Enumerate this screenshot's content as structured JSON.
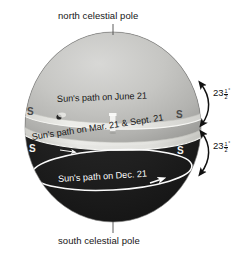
{
  "diagram": {
    "background_color": "#ffffff",
    "sphere": {
      "upper_hemisphere_color": "#b9b9b7",
      "lower_hemisphere_color": "#1d1d1d",
      "outline_color": "#8a8a88"
    },
    "poles": {
      "north": {
        "label": "north celestial pole",
        "leader_line": true
      },
      "south": {
        "label": "south celestial pole",
        "leader_line": true
      }
    },
    "sun_paths": [
      {
        "id": "june",
        "label": "Sun's path on June 21",
        "band_color": "#e9e9e6",
        "on_dark": false,
        "s_marker_left": "S",
        "s_marker_right": "S"
      },
      {
        "id": "equinox",
        "label": "Sun's path on Mar. 21 & Sept. 21",
        "band_color": "#e3e3df",
        "on_dark": false,
        "s_marker_left": "S",
        "s_marker_right": "S"
      },
      {
        "id": "december",
        "label": "Sun's path on Dec. 21",
        "band_color": "#ffffff",
        "on_dark": true,
        "s_marker_left": "",
        "s_marker_right": ""
      }
    ],
    "angles": [
      {
        "id": "upper",
        "whole": "23",
        "fraction_numerator": "1",
        "fraction_denominator": "2",
        "degree_symbol": "°",
        "full_text": "23½°",
        "arrow_style": "double-headed-curved",
        "description": "angle between June solstice path and celestial equator"
      },
      {
        "id": "lower",
        "whole": "23",
        "fraction_numerator": "1",
        "fraction_denominator": "2",
        "degree_symbol": "°",
        "full_text": "23½°",
        "arrow_style": "double-headed-curved",
        "description": "angle between celestial equator and December solstice path"
      }
    ],
    "observer_marker": {
      "name": "observer-pillar",
      "color": "#f4f4f2"
    },
    "sun_dot": {
      "name": "sun-position-dot",
      "color": "#262626"
    }
  }
}
